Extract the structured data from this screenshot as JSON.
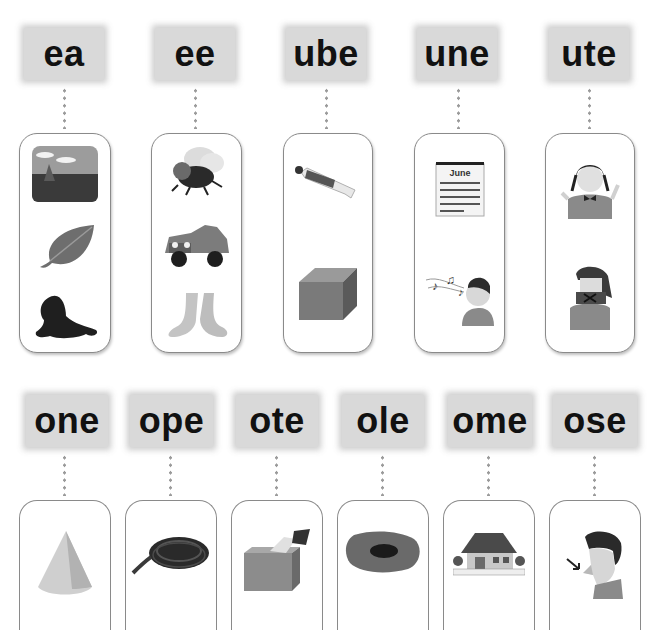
{
  "row1": {
    "groups": [
      {
        "label": "ea",
        "pictures": [
          "sea",
          "leaf",
          "seal"
        ]
      },
      {
        "label": "ee",
        "pictures": [
          "bee",
          "jeep",
          "feet"
        ]
      },
      {
        "label": "ube",
        "pictures": [
          "tube",
          "cube"
        ]
      },
      {
        "label": "une",
        "pictures": [
          "June calendar",
          "tune"
        ]
      },
      {
        "label": "ute",
        "pictures": [
          "cute girl",
          "flute"
        ]
      }
    ]
  },
  "row2": {
    "groups": [
      {
        "label": "one",
        "pictures": [
          "cone"
        ]
      },
      {
        "label": "ope",
        "pictures": [
          "rope"
        ]
      },
      {
        "label": "ote",
        "pictures": [
          "vote"
        ]
      },
      {
        "label": "ole",
        "pictures": [
          "hole"
        ]
      },
      {
        "label": "ome",
        "pictures": [
          "home"
        ]
      },
      {
        "label": "ose",
        "pictures": [
          "nose"
        ]
      }
    ]
  },
  "calendar": {
    "month": "June"
  }
}
